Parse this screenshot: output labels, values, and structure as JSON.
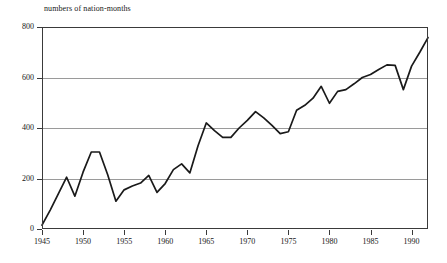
{
  "chart_data": {
    "type": "line",
    "title": "numbers of nation-months",
    "xlabel": "",
    "ylabel": "numbers of nation-months",
    "xlim": [
      1945,
      1992
    ],
    "ylim": [
      0,
      800
    ],
    "grid": true,
    "legend": null,
    "y_ticks": [
      0,
      200,
      400,
      600,
      800
    ],
    "y_tick_labels": [
      "0",
      "200",
      "400",
      "600",
      "800"
    ],
    "x_ticks": [
      1945,
      1950,
      1955,
      1960,
      1965,
      1970,
      1975,
      1980,
      1985,
      1990
    ],
    "x_tick_labels": [
      "1945",
      "1950",
      "1955",
      "1960",
      "1965",
      "1970",
      "1975",
      "1980",
      "1985",
      "1990"
    ],
    "line_color": "#1a1a1a",
    "grid_color": "#9a9a9a",
    "axis_color": "#3a3a3a",
    "x": [
      1945,
      1946,
      1947,
      1948,
      1949,
      1950,
      1951,
      1952,
      1953,
      1954,
      1955,
      1956,
      1957,
      1958,
      1959,
      1960,
      1961,
      1962,
      1963,
      1964,
      1965,
      1966,
      1967,
      1968,
      1969,
      1970,
      1971,
      1972,
      1973,
      1974,
      1975,
      1976,
      1977,
      1978,
      1979,
      1980,
      1981,
      1982,
      1983,
      1984,
      1985,
      1986,
      1987,
      1988,
      1989,
      1990,
      1991,
      1992
    ],
    "values": [
      15,
      75,
      140,
      205,
      130,
      225,
      305,
      305,
      215,
      110,
      155,
      170,
      182,
      212,
      145,
      180,
      235,
      258,
      222,
      330,
      420,
      390,
      363,
      363,
      400,
      430,
      465,
      440,
      410,
      378,
      385,
      470,
      490,
      518,
      565,
      498,
      545,
      552,
      575,
      600,
      612,
      632,
      650,
      648,
      552,
      645,
      700,
      758
    ],
    "series": [
      {
        "name": "numbers of nation-months",
        "values": [
          15,
          75,
          140,
          205,
          130,
          225,
          305,
          305,
          215,
          110,
          155,
          170,
          182,
          212,
          145,
          180,
          235,
          258,
          222,
          330,
          420,
          390,
          363,
          363,
          400,
          430,
          465,
          440,
          410,
          378,
          385,
          470,
          490,
          518,
          565,
          498,
          545,
          552,
          575,
          600,
          612,
          632,
          650,
          648,
          552,
          645,
          700,
          758
        ]
      }
    ]
  }
}
